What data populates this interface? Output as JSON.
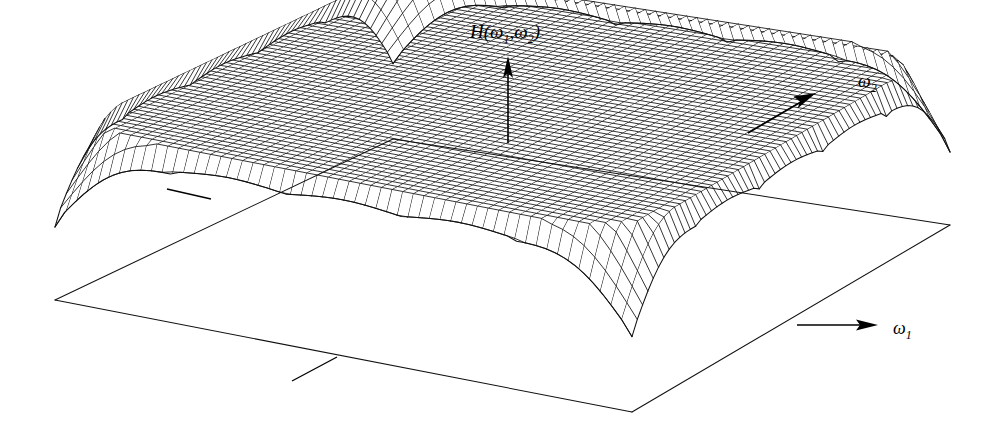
{
  "figure": {
    "kind": "3d-wireframe-surface-plot",
    "background_color": "#ffffff",
    "line_color": "#111111",
    "axis_color": "#000000"
  },
  "labels": {
    "vertical_axis": {
      "text": "H(ω₁,ω₂)",
      "base": "H(",
      "omega": "ω",
      "sub1": "1",
      "comma": ",",
      "sub2": "2",
      "close": ")"
    },
    "omega1": {
      "text": "ω₁",
      "symbol": "ω",
      "subscript": "1"
    },
    "omega2": {
      "text": "ω₂",
      "symbol": "ω",
      "subscript": "2"
    }
  },
  "chart_data": {
    "type": "surface",
    "xlabel": "ω₁",
    "ylabel": "ω₂",
    "zlabel": "H(ω₁,ω₂)",
    "grid": false,
    "legend": "none",
    "function": "periodic array of identical gaussian peaks on a zero baseline",
    "peak_lattice": {
      "rows": 5,
      "cols": 5,
      "count": 25
    },
    "peak_amplitude": 1.0,
    "baseline_value": 0.0,
    "mesh": {
      "u_lines": 61,
      "v_lines": 61,
      "ribs_u": 31,
      "ribs_v": 31
    },
    "xlim": [
      0,
      5
    ],
    "ylim": [
      0,
      5
    ],
    "zlim": [
      0,
      1
    ],
    "projection": {
      "type": "oblique-perspective",
      "corner_left": [
        55,
        300
      ],
      "corner_front": [
        632,
        412
      ],
      "corner_right": [
        950,
        225
      ],
      "corner_back": [
        393,
        139
      ]
    },
    "annotations": [
      {
        "name": "vertical-axis-arrow",
        "label": "H(ω₁,ω₂)",
        "direction": "up"
      },
      {
        "name": "omega2-axis-arrow",
        "label": "ω₂",
        "direction": "up-right"
      },
      {
        "name": "omega1-axis-arrow",
        "label": "ω₁",
        "direction": "right"
      }
    ]
  }
}
